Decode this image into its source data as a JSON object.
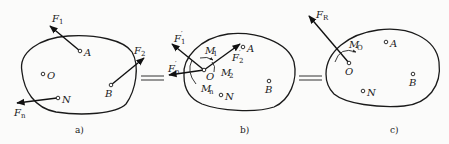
{
  "figure": {
    "colors": {
      "ink": "#1a1a1a",
      "background": "#fbfbfa"
    },
    "panels": [
      {
        "id": "a",
        "caption": "a)",
        "points": {
          "A": "A",
          "O": "O",
          "B": "B",
          "N": "N"
        },
        "forces": {
          "F1": "F",
          "F1_sub": "1",
          "F2": "F",
          "F2_sub": "2",
          "Fn": "F",
          "Fn_sub": "n"
        }
      },
      {
        "id": "b",
        "caption": "b)",
        "points": {
          "A": "A",
          "O": "O",
          "B": "B",
          "N": "N"
        },
        "forces": {
          "F1p": "F",
          "F1p_sub": "1",
          "F1p_prime": "′",
          "F2p": "F",
          "F2p_sub": "2",
          "F2p_prime": "′",
          "Fnp": "F",
          "Fnp_sub": "n",
          "Fnp_prime": "′"
        },
        "moments": {
          "M1": "M",
          "M1_sub": "1",
          "M2": "M",
          "M2_sub": "2",
          "Mn": "M",
          "Mn_sub": "n"
        }
      },
      {
        "id": "c",
        "caption": "c)",
        "points": {
          "A": "A",
          "O": "O",
          "B": "B",
          "N": "N"
        },
        "forces": {
          "FR": "F",
          "FR_sub": "R"
        },
        "moments": {
          "MO": "M",
          "MO_sub": "O"
        }
      }
    ],
    "equals_sign": "="
  }
}
